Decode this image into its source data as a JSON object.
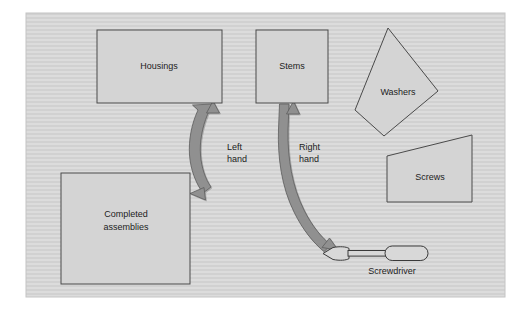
{
  "diagram": {
    "frame": {
      "x": 26,
      "y": 13,
      "width": 479,
      "height": 284
    },
    "background_color": "#d9d9d9",
    "shape_fill_color": "#d4d4d4",
    "shape_stroke_color": "#4a4a4a",
    "arrow_color": "#909090",
    "text_color": "#1c1c1c",
    "nodes": [
      {
        "id": "housings",
        "label": "Housings",
        "shape": "rectangle",
        "x": 97,
        "y": 30,
        "width": 125,
        "height": 73,
        "label_x": 159,
        "label_y": 67
      },
      {
        "id": "stems",
        "label": "Stems",
        "shape": "rectangle",
        "x": 256,
        "y": 30,
        "width": 72,
        "height": 73,
        "label_x": 292,
        "label_y": 67
      },
      {
        "id": "washers",
        "label": "Washers",
        "shape": "quadrilateral",
        "points": "388,28 438,91 384,136 355,110",
        "label_x": 398,
        "label_y": 93
      },
      {
        "id": "screws",
        "label": "Screws",
        "shape": "trapezoid",
        "points": "387,156 472,135 472,202 387,202",
        "label_x": 430,
        "label_y": 178
      },
      {
        "id": "completed-assemblies",
        "label_line1": "Completed",
        "label_line2": "assemblies",
        "shape": "rectangle",
        "x": 61,
        "y": 173,
        "width": 129,
        "height": 111,
        "label_x": 126,
        "label_y": 219
      },
      {
        "id": "screwdriver",
        "label": "Screwdriver",
        "shape": "tool",
        "label_x": 392,
        "label_y": 272
      }
    ],
    "arrows": [
      {
        "id": "left-hand-arrow",
        "label_line1": "Left",
        "label_line2": "hand",
        "label_x": 227,
        "label_y": 150,
        "from": "housings",
        "to": "completed-assemblies",
        "double_headed": true
      },
      {
        "id": "right-hand-arrow",
        "label_line1": "Right",
        "label_line2": "hand",
        "label_x": 299,
        "label_y": 150,
        "from": "stems",
        "to": "screwdriver",
        "double_headed": true
      }
    ]
  }
}
